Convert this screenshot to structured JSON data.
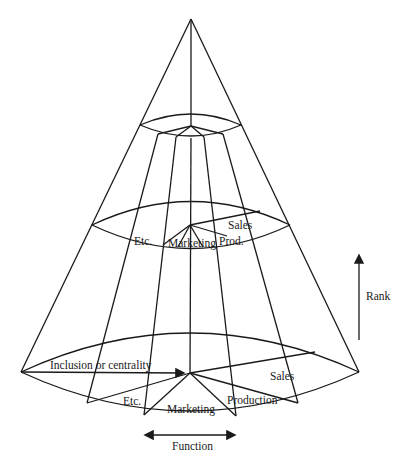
{
  "diagram": {
    "axes": {
      "vertical": "Rank",
      "horizontal": "Function",
      "radial": "Inclusion or centrality"
    },
    "middle_level_labels": {
      "etc": "Etc.",
      "marketing": "Marketing",
      "production": "Prod.",
      "sales": "Sales"
    },
    "base_level_labels": {
      "etc": "Etc.",
      "marketing": "Marketing",
      "production": "Production",
      "sales": "Sales",
      "inclusion": "Inclusion or centrality"
    }
  }
}
